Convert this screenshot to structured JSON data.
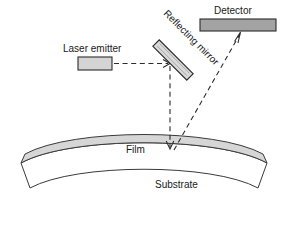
{
  "figure": {
    "background_color": "#ffffff",
    "width": 288,
    "height": 239
  },
  "labels": {
    "laser_emitter": "Laser emitter",
    "reflecting_mirror": "Reflecting mirror",
    "detector": "Detector",
    "film": "Film",
    "substrate": "Substrate"
  },
  "colors": {
    "outline": "#2b2b2b",
    "emitter_fill": "#d4d4d4",
    "mirror_fill": "#d9d9d9",
    "detector_fill": "#a3a3a3",
    "film_fill": "#d6d6d6",
    "substrate_fill": "#ffffff",
    "beam": "#2b2b2b",
    "text": "#1a1a1a"
  },
  "components": {
    "laser_emitter": {
      "name": "Laser emitter",
      "shape": "rectangle",
      "x": 78,
      "y": 57,
      "width": 34,
      "height": 13,
      "fill": "#d4d4d4"
    },
    "reflecting_mirror": {
      "name": "Reflecting mirror",
      "shape": "rotated-bar",
      "center_x": 173,
      "center_y": 60,
      "length": 48,
      "thickness": 9,
      "rotation_deg": 45,
      "fill": "#d9d9d9"
    },
    "detector": {
      "name": "Detector",
      "shape": "rectangle",
      "x": 200,
      "y": 19,
      "width": 76,
      "height": 12,
      "fill": "#a3a3a3"
    },
    "film": {
      "name": "Film",
      "shape": "curved-band",
      "fill": "#d6d6d6",
      "thickness": 9
    },
    "substrate": {
      "name": "Substrate",
      "shape": "curved-band",
      "fill": "#ffffff",
      "thickness": 30
    }
  },
  "beams": [
    {
      "id": "emitter-to-mirror",
      "style": "dashed",
      "from": "laser emitter",
      "to": "reflecting mirror",
      "direction": "horizontal-right",
      "x1": 114,
      "y1": 63,
      "x2": 169,
      "y2": 63,
      "arrow_at": "end"
    },
    {
      "id": "mirror-to-film",
      "style": "dashed",
      "from": "reflecting mirror",
      "to": "film surface",
      "direction": "vertical-down",
      "x1": 170,
      "y1": 66,
      "x2": 170,
      "y2": 148,
      "arrow_at": "end"
    },
    {
      "id": "film-to-detector",
      "style": "dashed",
      "from": "film surface",
      "to": "detector",
      "direction": "diagonal-up-right",
      "x1": 175,
      "y1": 150,
      "x2": 240,
      "y2": 33,
      "arrow_at": "end"
    }
  ],
  "label_positions": {
    "laser_emitter": {
      "x": 63,
      "y": 52,
      "rotation": 0
    },
    "reflecting_mirror": {
      "x": 163,
      "y": 14,
      "rotation": 45
    },
    "detector": {
      "x": 214,
      "y": 14,
      "rotation": 0
    },
    "film": {
      "x": 126,
      "y": 152,
      "rotation": 0
    },
    "substrate": {
      "x": 155,
      "y": 187,
      "rotation": 0
    }
  }
}
